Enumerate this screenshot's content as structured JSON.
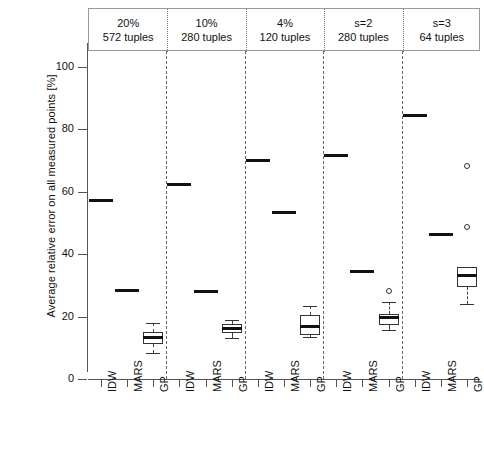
{
  "chart_data": {
    "type": "box",
    "title": "",
    "xlabel": "",
    "ylabel": "Average relative error on all measured points [%]",
    "ylim": [
      0,
      105
    ],
    "yticks": [
      0,
      20,
      40,
      60,
      80,
      100
    ],
    "ytick_labels": [
      "0",
      "20",
      "40",
      "60",
      "80",
      "100"
    ],
    "grid": false,
    "legend": null,
    "panel_titles": [
      {
        "line1": "20%",
        "line2": "572 tuples"
      },
      {
        "line1": "10%",
        "line2": "280 tuples"
      },
      {
        "line1": "4%",
        "line2": "120 tuples"
      },
      {
        "line1": "s=2",
        "line2": "280 tuples"
      },
      {
        "line1": "s=3",
        "line2": "64 tuples"
      }
    ],
    "methods": [
      "IDW",
      "MARS",
      "GP"
    ],
    "categories": [
      "IDW",
      "MARS",
      "GP",
      "IDW",
      "MARS",
      "GP",
      "IDW",
      "MARS",
      "GP",
      "IDW",
      "MARS",
      "GP",
      "IDW",
      "MARS",
      "GP"
    ],
    "panels": [
      {
        "name": "20% / 572 tuples",
        "boxes": [
          {
            "method": "IDW",
            "kind": "single",
            "value": 57.2
          },
          {
            "method": "MARS",
            "kind": "single",
            "value": 28.4
          },
          {
            "method": "GP",
            "kind": "box",
            "whisker_low": 8.3,
            "q1": 11.3,
            "median": 13.2,
            "q3": 15.2,
            "whisker_high": 18.0,
            "outliers": []
          }
        ]
      },
      {
        "name": "10% / 280 tuples",
        "boxes": [
          {
            "method": "IDW",
            "kind": "single",
            "value": 62.4
          },
          {
            "method": "MARS",
            "kind": "single",
            "value": 28.0
          },
          {
            "method": "GP",
            "kind": "box",
            "whisker_low": 13.0,
            "q1": 14.6,
            "median": 16.2,
            "q3": 17.6,
            "whisker_high": 19.0,
            "outliers": []
          }
        ]
      },
      {
        "name": "4% / 120 tuples",
        "boxes": [
          {
            "method": "IDW",
            "kind": "single",
            "value": 70.0
          },
          {
            "method": "MARS",
            "kind": "single",
            "value": 53.4
          },
          {
            "method": "GP",
            "kind": "box",
            "whisker_low": 13.5,
            "q1": 14.2,
            "median": 16.8,
            "q3": 20.5,
            "whisker_high": 23.5,
            "outliers": []
          }
        ]
      },
      {
        "name": "s=2 / 280 tuples",
        "boxes": [
          {
            "method": "IDW",
            "kind": "single",
            "value": 71.5
          },
          {
            "method": "MARS",
            "kind": "single",
            "value": 34.3
          },
          {
            "method": "GP",
            "kind": "box",
            "whisker_low": 15.8,
            "q1": 17.2,
            "median": 19.6,
            "q3": 20.8,
            "whisker_high": 24.8,
            "outliers": [
              28.3
            ]
          }
        ]
      },
      {
        "name": "s=3 / 64 tuples",
        "boxes": [
          {
            "method": "IDW",
            "kind": "single",
            "value": 84.2
          },
          {
            "method": "MARS",
            "kind": "single",
            "value": 46.4
          },
          {
            "method": "GP",
            "kind": "box",
            "whisker_low": 24.0,
            "q1": 29.5,
            "median": 33.0,
            "q3": 36.0,
            "whisker_high": 36.0,
            "outliers": [
              48.8,
              68.3
            ]
          }
        ]
      }
    ]
  }
}
